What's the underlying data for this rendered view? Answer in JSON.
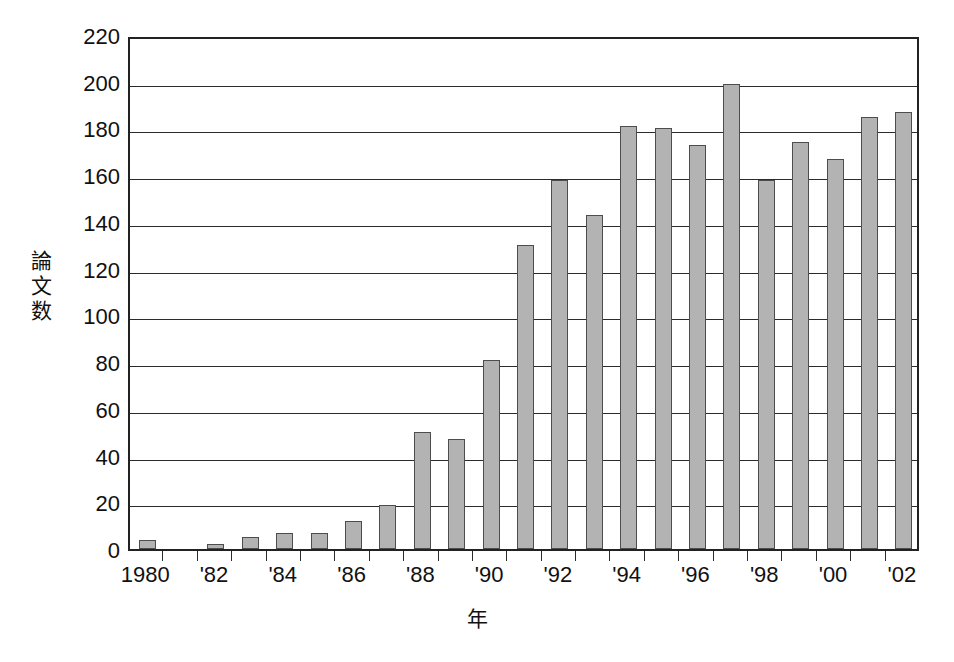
{
  "chart_data": {
    "type": "bar",
    "title": "",
    "xlabel": "年",
    "ylabel": "論文数",
    "ylim": [
      0,
      220
    ],
    "ytick_step": 20,
    "grid": true,
    "legend": "none",
    "bar_color": "#b3b3b3",
    "bar_border_color": "#4d4d4d",
    "axis_color": "#222222",
    "categories": [
      "1980",
      "1981",
      "1982",
      "1983",
      "1984",
      "1985",
      "1986",
      "1987",
      "1988",
      "1989",
      "1990",
      "1991",
      "1992",
      "1993",
      "1994",
      "1995",
      "1996",
      "1997",
      "1998",
      "1999",
      "2000",
      "2001",
      "2002"
    ],
    "values": [
      4,
      0,
      2,
      5,
      7,
      7,
      12,
      19,
      50,
      47,
      81,
      130,
      158,
      143,
      181,
      180,
      173,
      199,
      158,
      174,
      167,
      185,
      187
    ],
    "ytick_labels": [
      "220",
      "200",
      "180",
      "160",
      "140",
      "120",
      "100",
      "80",
      "60",
      "40",
      "20",
      "0"
    ],
    "ytick_values": [
      220,
      200,
      180,
      160,
      140,
      120,
      100,
      80,
      60,
      40,
      20,
      0
    ],
    "xtick_labels": [
      "1980",
      "'82",
      "'84",
      "'86",
      "'88",
      "'90",
      "'92",
      "'94",
      "'96",
      "'98",
      "'00",
      "'02"
    ],
    "xtick_categories": [
      "1980",
      "1982",
      "1984",
      "1986",
      "1988",
      "1990",
      "1992",
      "1994",
      "1996",
      "1998",
      "2000",
      "2002"
    ]
  }
}
